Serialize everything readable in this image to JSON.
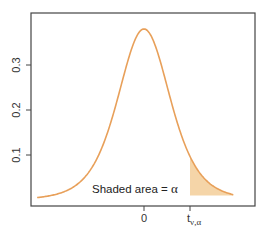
{
  "chart_data": {
    "type": "line",
    "title": "",
    "xlabel": "",
    "ylabel": "",
    "distribution": "Student t density",
    "x_ticks": [
      {
        "value": 0,
        "label": "0"
      },
      {
        "value": 1.7,
        "label": "t",
        "subscript": "ν,α"
      }
    ],
    "y_ticks": [
      {
        "value": 0.1,
        "label": "0.1"
      },
      {
        "value": 0.2,
        "label": "0.2"
      },
      {
        "value": 0.3,
        "label": "0.3"
      }
    ],
    "xlim": [
      -4.3,
      4.3
    ],
    "ylim": [
      0,
      0.42
    ],
    "peak": {
      "x": 0,
      "y": 0.38
    },
    "x": [
      -3.8,
      -3.0,
      -2.5,
      -2.0,
      -1.5,
      -1.0,
      -0.5,
      0,
      0.5,
      1.0,
      1.5,
      2.0,
      2.5,
      3.0,
      3.8
    ],
    "values": [
      0.013,
      0.022,
      0.035,
      0.061,
      0.114,
      0.203,
      0.317,
      0.38,
      0.317,
      0.203,
      0.114,
      0.061,
      0.035,
      0.022,
      0.013
    ],
    "shaded_region": {
      "from": "t_ν,α",
      "to": "+∞",
      "color": "#f5d5a8",
      "label": "Shaded area = α"
    },
    "line_color": "#e8a05a",
    "grid": false,
    "legend": null
  },
  "annotation": {
    "text": "Shaded area = ",
    "symbol": "α"
  },
  "colors": {
    "curve": "#e8a05a",
    "shade": "#f5d5a8",
    "axis": "#444444"
  }
}
